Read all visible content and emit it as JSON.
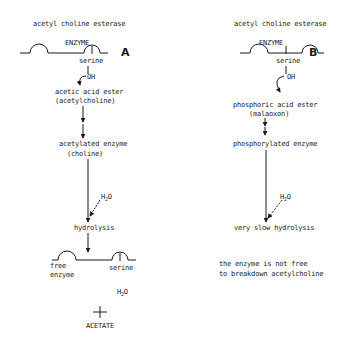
{
  "panelA": {
    "label": "A",
    "title": "acetyl choline esterase",
    "enzyme_label": "ENZYME",
    "serine_label": "serine",
    "oh_label": "OH",
    "substrate_line1": "acetic acid ester",
    "substrate_line2": "(acetylcholine)",
    "intermediate_line1": "acetylated enzyme",
    "intermediate_line2": "(choline)",
    "water_label": "H2O",
    "hydrolysis_label": "hydrolysis",
    "free_enzyme_line1": "free",
    "free_enzyme_line2": "enzyme",
    "serine_label_2": "serine",
    "water_product": "H2O",
    "plus": "+",
    "acetate_label": "ACETATE"
  },
  "panelB": {
    "label": "B",
    "title": "acetyl choline esterase",
    "enzyme_label": "ENZYME",
    "serine_label": "serine",
    "oh_label": "OH",
    "substrate_line1": "phosphoric acid ester",
    "substrate_line2": "(malaoxon)",
    "intermediate_line1": "phosphorylated enzyme",
    "water_label": "H2O",
    "hydrolysis_label": "very slow hydrolysis",
    "conclusion_line1": "the enzyme is not free",
    "conclusion_line2": "to breakdown acetylcholine"
  },
  "colors": {
    "ink": "#1a1a1a",
    "background": "#ffffff"
  }
}
